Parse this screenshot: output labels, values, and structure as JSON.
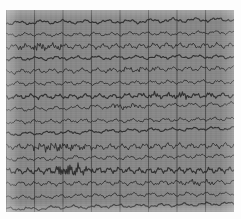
{
  "document": {
    "title": "EEG Recording Strip",
    "media": "scanned chart paper"
  },
  "colors": {
    "paper": "#8b8b8b",
    "page_background": "#fdfdfd",
    "trace": "#2a2a2a",
    "grid_minor": "#7b7b7b",
    "grid_major": "#4f4f4f",
    "grid_horizontal": "#7f7f7f"
  },
  "chart_data": {
    "type": "line",
    "title": "",
    "subtitle": "",
    "xlabel": "",
    "ylabel": "",
    "legend_position": "none",
    "grid": true,
    "plot_area": {
      "x": 6,
      "y": 10,
      "width": 228,
      "height": 202
    },
    "axis": {
      "x_range": [
        0,
        228
      ],
      "y_range": [
        0,
        202
      ],
      "x_tick_minor_spacing": 5.0,
      "x_tick_major_spacing": 28.5,
      "y_tick_minor_spacing": 6.3,
      "y_tick_major_spacing": 12.6,
      "x_tick_labels": [],
      "y_tick_labels": []
    },
    "channel_count": 16,
    "channel_spacing": 12.6,
    "channel_baseline_start": 13,
    "series": [
      {
        "name": "ch01",
        "baseline": 13,
        "amplitude": 2.4,
        "frequency": 0.55,
        "drift": -3.5,
        "burst": null
      },
      {
        "name": "ch02",
        "baseline": 25,
        "amplitude": 2.1,
        "frequency": 0.7,
        "drift": -2.0,
        "burst": null
      },
      {
        "name": "ch03",
        "baseline": 37,
        "amplitude": 3.0,
        "frequency": 0.95,
        "drift": -1.5,
        "burst": {
          "start": 0.02,
          "end": 0.3,
          "gain": 1.8
        }
      },
      {
        "name": "ch04",
        "baseline": 49,
        "amplitude": 2.2,
        "frequency": 0.6,
        "drift": -2.5,
        "burst": null
      },
      {
        "name": "ch05",
        "baseline": 62,
        "amplitude": 2.6,
        "frequency": 0.8,
        "drift": -4.0,
        "burst": {
          "start": 0.38,
          "end": 0.72,
          "gain": 1.5
        }
      },
      {
        "name": "ch06",
        "baseline": 74,
        "amplitude": 2.3,
        "frequency": 0.72,
        "drift": -2.0,
        "burst": null
      },
      {
        "name": "ch07",
        "baseline": 87,
        "amplitude": 2.8,
        "frequency": 0.88,
        "drift": -1.8,
        "burst": {
          "start": 0.55,
          "end": 0.95,
          "gain": 1.6
        }
      },
      {
        "name": "ch08",
        "baseline": 99,
        "amplitude": 2.5,
        "frequency": 0.62,
        "drift": -5.0,
        "burst": {
          "start": 0.4,
          "end": 0.62,
          "gain": 1.7
        }
      },
      {
        "name": "ch09",
        "baseline": 112,
        "amplitude": 2.2,
        "frequency": 0.74,
        "drift": -3.0,
        "burst": null
      },
      {
        "name": "ch10",
        "baseline": 124,
        "amplitude": 2.0,
        "frequency": 0.58,
        "drift": -6.0,
        "burst": null
      },
      {
        "name": "ch11",
        "baseline": 137,
        "amplitude": 3.2,
        "frequency": 1.05,
        "drift": -1.2,
        "burst": {
          "start": 0.05,
          "end": 0.42,
          "gain": 1.9
        }
      },
      {
        "name": "ch12",
        "baseline": 149,
        "amplitude": 2.4,
        "frequency": 0.68,
        "drift": -2.8,
        "burst": null
      },
      {
        "name": "ch13",
        "baseline": 161,
        "amplitude": 3.4,
        "frequency": 1.2,
        "drift": -1.0,
        "burst": {
          "start": 0.18,
          "end": 0.4,
          "gain": 2.4
        }
      },
      {
        "name": "ch14",
        "baseline": 174,
        "amplitude": 2.6,
        "frequency": 0.85,
        "drift": -2.2,
        "burst": {
          "start": 0.7,
          "end": 0.98,
          "gain": 1.6
        }
      },
      {
        "name": "ch15",
        "baseline": 187,
        "amplitude": 2.3,
        "frequency": 0.66,
        "drift": -3.2,
        "burst": null
      },
      {
        "name": "ch16",
        "baseline": 199,
        "amplitude": 2.0,
        "frequency": 0.55,
        "drift": -5.5,
        "burst": null
      }
    ],
    "major_vertical_lines": [
      6,
      34.5,
      63,
      91.5,
      120,
      148.5,
      177,
      205.5
    ],
    "annotations": []
  }
}
